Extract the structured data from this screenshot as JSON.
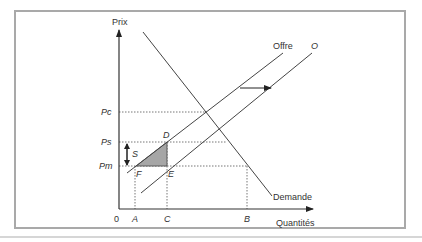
{
  "diagram": {
    "axes": {
      "y_label": "Prix",
      "x_label": "Quantités",
      "origin_label": "0"
    },
    "price_labels": {
      "pc": "Pc",
      "ps": "Ps",
      "pm": "Pm"
    },
    "quantity_labels": {
      "a": "A",
      "c": "C",
      "b": "B"
    },
    "points": {
      "d": "D",
      "f": "F",
      "e": "E"
    },
    "curves": {
      "supply": "Offre",
      "shifted_supply": "O",
      "demand": "Demande"
    },
    "subsidy_label": "S",
    "colors": {
      "frame": "#a9a9a9",
      "lines": "#444444",
      "dotted": "#777777",
      "triangle_fill": "#a6a6a6"
    }
  }
}
